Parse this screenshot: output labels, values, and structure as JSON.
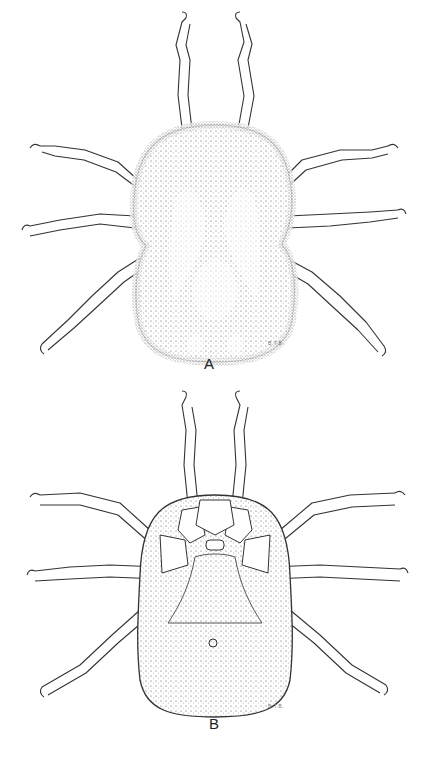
{
  "figure": {
    "panels": [
      {
        "id": "A",
        "label": "A",
        "view": "dorsal",
        "initials": "B.T.B."
      },
      {
        "id": "B",
        "label": "B",
        "view": "ventral",
        "initials": "B.T.B."
      }
    ],
    "colors": {
      "ink": "#222222",
      "stipple": "#555555",
      "background": "#ffffff"
    }
  }
}
